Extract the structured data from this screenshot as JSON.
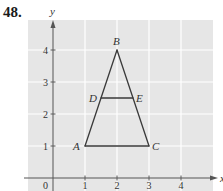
{
  "problem": {
    "number": "48."
  },
  "axes": {
    "x_label": "x",
    "y_label": "y",
    "origin_label": "0",
    "x_ticks": [
      {
        "value": 1,
        "label": "1"
      },
      {
        "value": 2,
        "label": "2"
      },
      {
        "value": 3,
        "label": "3"
      },
      {
        "value": 4,
        "label": "4"
      }
    ],
    "y_ticks": [
      {
        "value": 1,
        "label": "1"
      },
      {
        "value": 2,
        "label": "2"
      },
      {
        "value": 3,
        "label": "3"
      },
      {
        "value": 4,
        "label": "4"
      }
    ]
  },
  "points": [
    {
      "label": "A",
      "x": 1,
      "y": 1
    },
    {
      "label": "B",
      "x": 2,
      "y": 4
    },
    {
      "label": "C",
      "x": 3,
      "y": 1
    },
    {
      "label": "D",
      "x": 1.5,
      "y": 2.5
    },
    {
      "label": "E",
      "x": 2.5,
      "y": 2.5
    }
  ],
  "segments": [
    {
      "from": "A",
      "to": "B"
    },
    {
      "from": "B",
      "to": "C"
    },
    {
      "from": "C",
      "to": "A"
    },
    {
      "from": "D",
      "to": "E"
    }
  ],
  "colors": {
    "grid_background": "#e6e6e6",
    "grid_lines": "#ffffff",
    "axis": "#555555",
    "figure_line": "#3a3a3a",
    "text": "#333333"
  }
}
